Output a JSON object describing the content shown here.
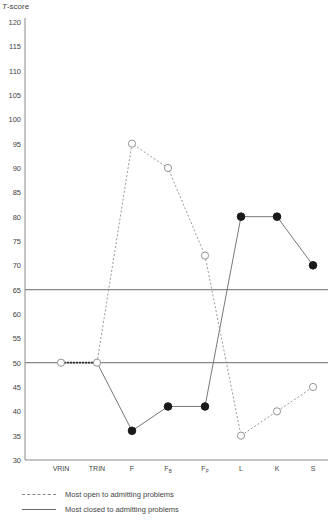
{
  "chart_data": {
    "type": "line",
    "title": "",
    "ylabel": "T-score",
    "xlabel": "",
    "ylim": [
      30,
      120
    ],
    "yticks": [
      30,
      35,
      40,
      45,
      50,
      55,
      60,
      65,
      70,
      75,
      80,
      85,
      90,
      95,
      100,
      105,
      110,
      115,
      120
    ],
    "categories": [
      "VRIN",
      "TRIN",
      "F",
      "F_B",
      "F_P",
      "L",
      "K",
      "S"
    ],
    "category_labels": [
      {
        "main": "VRIN",
        "sub": ""
      },
      {
        "main": "TRIN",
        "sub": ""
      },
      {
        "main": "F",
        "sub": ""
      },
      {
        "main": "F",
        "sub": "B"
      },
      {
        "main": "F",
        "sub": "P"
      },
      {
        "main": "L",
        "sub": ""
      },
      {
        "main": "K",
        "sub": ""
      },
      {
        "main": "S",
        "sub": ""
      }
    ],
    "reference_lines": [
      65,
      50
    ],
    "grid": false,
    "legend_position": "bottom",
    "series": [
      {
        "name": "Most open to admitting problems",
        "style": "dashed",
        "marker": "open-circle",
        "values": [
          50,
          50,
          95,
          90,
          72,
          35,
          40,
          45
        ]
      },
      {
        "name": "Most closed to admitting problems",
        "style": "solid",
        "marker": "filled-circle",
        "values": [
          50,
          50,
          36,
          41,
          41,
          80,
          80,
          70
        ],
        "marker_open_indices": [
          0,
          1
        ]
      }
    ]
  },
  "axis": {
    "y_title_prefix": "T",
    "y_title_suffix": "-score"
  },
  "legend": {
    "items": [
      {
        "label": "Most open to admitting problems",
        "style": "dashed"
      },
      {
        "label": "Most closed to admitting problems",
        "style": "solid"
      }
    ]
  },
  "colors": {
    "axis": "#888888",
    "reference_line": "#888888",
    "open_series": "#999999",
    "closed_series": "#777777",
    "filled_marker": "#1a1a1a",
    "text": "#444444"
  }
}
